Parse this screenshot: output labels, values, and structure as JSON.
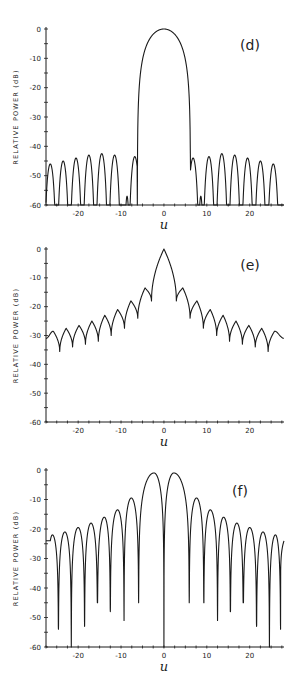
{
  "page": {
    "header_mark": ""
  },
  "chart_data": [
    {
      "type": "line",
      "panel": "(d)",
      "title": "",
      "xlabel": "u",
      "ylabel": "RELATIVE POWER (dB)",
      "xlim": [
        -27.5,
        28
      ],
      "ylim": [
        -60,
        0
      ],
      "xticks": [
        -20,
        -10,
        0,
        10,
        20
      ],
      "yticks": [
        0,
        -10,
        -20,
        -30,
        -40,
        -50,
        -60
      ],
      "grid": false,
      "description": "Main lobe peaking at 0 dB centered at u=0 with nulls near u=±6; sidelobes around -43 to -48 dB; small sidelobes near u=±8.5 at about -57 dB",
      "main_lobe": {
        "center": 0,
        "peak_db": 0,
        "null_left": -6.2,
        "null_right": 6.2
      },
      "sidelobes": [
        {
          "u": -26.5,
          "db": -46
        },
        {
          "u": -23.5,
          "db": -45
        },
        {
          "u": -20.5,
          "db": -44
        },
        {
          "u": -17.5,
          "db": -43
        },
        {
          "u": -14.5,
          "db": -42.5
        },
        {
          "u": -11.5,
          "db": -43
        },
        {
          "u": -8.6,
          "db": -57
        },
        {
          "u": -6.8,
          "db": -43.5
        },
        {
          "u": 6.8,
          "db": -44
        },
        {
          "u": 8.6,
          "db": -57
        },
        {
          "u": 10.5,
          "db": -43.5
        },
        {
          "u": 13.5,
          "db": -42.5
        },
        {
          "u": 16.5,
          "db": -43
        },
        {
          "u": 19.5,
          "db": -44
        },
        {
          "u": 22.5,
          "db": -45
        },
        {
          "u": 25.5,
          "db": -46
        }
      ],
      "nulls_db": -60
    },
    {
      "type": "line",
      "panel": "(e)",
      "title": "",
      "xlabel": "u",
      "ylabel": "RELATIVE POWER (dB)",
      "xlim": [
        -27.5,
        28
      ],
      "ylim": [
        -60,
        0
      ],
      "xticks": [
        -20,
        -10,
        0,
        10,
        20
      ],
      "yticks": [
        0,
        -10,
        -20,
        -30,
        -40,
        -50,
        -60
      ],
      "grid": false,
      "description": "Main lobe 0 dB at u=0, shallow nulls; sidelobe envelope decaying from about -13 dB to about -29 dB at edges",
      "main_lobe": {
        "center": 0,
        "peak_db": 0,
        "null_left": -2.7,
        "null_right": 2.7
      },
      "sidelobes": [
        {
          "u": -25.8,
          "db": -28.5
        },
        {
          "u": -22.8,
          "db": -27.5
        },
        {
          "u": -19.8,
          "db": -26.5
        },
        {
          "u": -16.8,
          "db": -25
        },
        {
          "u": -13.8,
          "db": -23
        },
        {
          "u": -10.8,
          "db": -21
        },
        {
          "u": -7.7,
          "db": -18
        },
        {
          "u": -4.4,
          "db": -13.5
        },
        {
          "u": 4.4,
          "db": -13.5
        },
        {
          "u": 7.7,
          "db": -18
        },
        {
          "u": 10.8,
          "db": -21
        },
        {
          "u": 13.8,
          "db": -23
        },
        {
          "u": 16.8,
          "db": -25
        },
        {
          "u": 19.8,
          "db": -26.5
        },
        {
          "u": 22.8,
          "db": -27.5
        },
        {
          "u": 25.8,
          "db": -28.5
        }
      ],
      "troughs": [
        {
          "u": -24.3,
          "db": -35.5
        },
        {
          "u": -21.3,
          "db": -34
        },
        {
          "u": -18.3,
          "db": -33
        },
        {
          "u": -15.3,
          "db": -32
        },
        {
          "u": -12.3,
          "db": -30
        },
        {
          "u": -9.2,
          "db": -27.5
        },
        {
          "u": -6.1,
          "db": -24
        },
        {
          "u": -2.9,
          "db": -18
        },
        {
          "u": 2.9,
          "db": -18
        },
        {
          "u": 6.1,
          "db": -24
        },
        {
          "u": 9.2,
          "db": -27.5
        },
        {
          "u": 12.3,
          "db": -30
        },
        {
          "u": 15.3,
          "db": -32
        },
        {
          "u": 18.3,
          "db": -33
        },
        {
          "u": 21.3,
          "db": -34
        },
        {
          "u": 24.3,
          "db": -35.5
        }
      ]
    },
    {
      "type": "line",
      "panel": "(f)",
      "title": "",
      "xlabel": "u",
      "ylabel": "RELATIVE POWER (dB)",
      "xlim": [
        -27.5,
        28
      ],
      "ylim": [
        -60,
        0
      ],
      "xticks": [
        -20,
        -10,
        0,
        10,
        20
      ],
      "yticks": [
        0,
        -10,
        -20,
        -30,
        -40,
        -50,
        -60
      ],
      "grid": false,
      "description": "Difference pattern: twin main lobes at about -1 dB near u=±2 with deep null at u=0; sidelobes decaying from -9 dB to about -22 dB; deep nulls reaching -45 to -60 dB",
      "lobes": [
        {
          "u": -26.0,
          "db": -22
        },
        {
          "u": -23.1,
          "db": -21
        },
        {
          "u": -20.0,
          "db": -19.5
        },
        {
          "u": -17.0,
          "db": -18
        },
        {
          "u": -13.9,
          "db": -16
        },
        {
          "u": -10.8,
          "db": -13.5
        },
        {
          "u": -7.6,
          "db": -9.5
        },
        {
          "u": -2.3,
          "db": -1
        },
        {
          "u": 2.3,
          "db": -1
        },
        {
          "u": 7.6,
          "db": -9.5
        },
        {
          "u": 10.8,
          "db": -13.5
        },
        {
          "u": 13.9,
          "db": -16
        },
        {
          "u": 17.0,
          "db": -18
        },
        {
          "u": 20.0,
          "db": -19.5
        },
        {
          "u": 23.1,
          "db": -21
        },
        {
          "u": 26.0,
          "db": -22
        }
      ],
      "nulls": [
        {
          "u": -27.2,
          "db": -24
        },
        {
          "u": -24.6,
          "db": -54
        },
        {
          "u": -21.6,
          "db": -60
        },
        {
          "u": -18.5,
          "db": -53
        },
        {
          "u": -15.5,
          "db": -45
        },
        {
          "u": -12.5,
          "db": -48
        },
        {
          "u": -9.3,
          "db": -51
        },
        {
          "u": -5.9,
          "db": -45
        },
        {
          "u": 0,
          "db": -60
        },
        {
          "u": 5.9,
          "db": -45
        },
        {
          "u": 9.3,
          "db": -45
        },
        {
          "u": 12.5,
          "db": -51
        },
        {
          "u": 15.5,
          "db": -48
        },
        {
          "u": 18.5,
          "db": -45
        },
        {
          "u": 21.6,
          "db": -53
        },
        {
          "u": 24.6,
          "db": -60
        },
        {
          "u": 27.2,
          "db": -54
        }
      ]
    }
  ],
  "panels": [
    {
      "label": "(d)",
      "ylabel": "RELATIVE POWER (dB)",
      "xlabel": "u",
      "yticks": [
        "0",
        "-10",
        "-20",
        "-30",
        "-40",
        "-50",
        "-60"
      ],
      "xticks": [
        "-20",
        "-10",
        "0",
        "10",
        "20"
      ]
    },
    {
      "label": "(e)",
      "ylabel": "RELATIVE POWER (dB)",
      "xlabel": "u",
      "yticks": [
        "0",
        "-10",
        "-20",
        "-30",
        "-40",
        "-50",
        "-60"
      ],
      "xticks": [
        "-20",
        "-10",
        "0",
        "10",
        "20"
      ]
    },
    {
      "label": "(f)",
      "ylabel": "RELATIVE POWER (dB)",
      "xlabel": "u",
      "yticks": [
        "0",
        "-10",
        "-20",
        "-30",
        "-40",
        "-50",
        "-60"
      ],
      "xticks": [
        "-20",
        "-10",
        "0",
        "10",
        "20"
      ]
    }
  ],
  "style": {
    "ink": "#1a1a1a",
    "background": "#ffffff"
  }
}
